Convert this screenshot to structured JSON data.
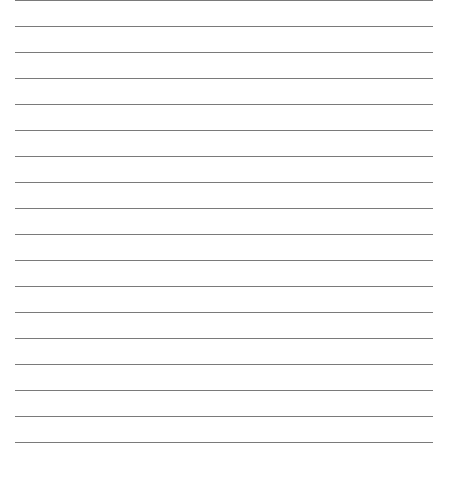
{
  "paper": {
    "type": "lined-paper",
    "line_count": 18,
    "line_spacing_px": 26,
    "first_line_y": 0,
    "line_color": "#7a7a7a",
    "background_color": "#ffffff"
  }
}
